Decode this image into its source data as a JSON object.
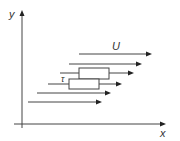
{
  "diagram": {
    "axes": {
      "x_label": "x",
      "y_label": "y"
    },
    "labels": {
      "velocity": "U",
      "shear": "τ"
    },
    "flow_arrows": 6,
    "elements": 2
  }
}
